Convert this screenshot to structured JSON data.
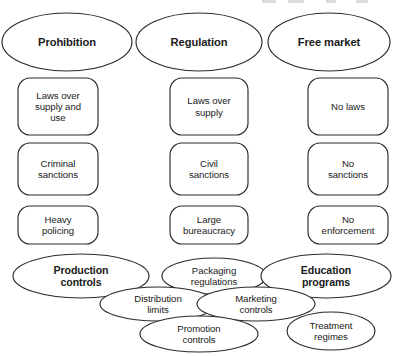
{
  "diagram": {
    "stroke_color": "#2b2b2b",
    "fill_color": "#ffffff",
    "categories": [
      {
        "id": "prohibition",
        "label": "Prohibition",
        "cx": 67,
        "cy": 42,
        "rx": 65,
        "ry": 29
      },
      {
        "id": "regulation",
        "label": "Regulation",
        "cx": 199,
        "cy": 42,
        "rx": 63,
        "ry": 29
      },
      {
        "id": "free-market",
        "label": "Free market",
        "cx": 329,
        "cy": 42,
        "rx": 61,
        "ry": 29
      }
    ],
    "attribute_rows": [
      {
        "row_id": "laws",
        "items": [
          {
            "id": "laws-over-supply-and-use",
            "label": "Laws over\nsupply and\nuse",
            "x": 18,
            "y": 78,
            "w": 80,
            "h": 57
          },
          {
            "id": "laws-over-supply",
            "label": "Laws over\nsupply",
            "x": 170,
            "y": 78,
            "w": 78,
            "h": 57
          },
          {
            "id": "no-laws",
            "label": "No laws",
            "x": 308,
            "y": 78,
            "w": 80,
            "h": 57
          }
        ]
      },
      {
        "row_id": "sanctions",
        "items": [
          {
            "id": "criminal-sanctions",
            "label": "Criminal\nsanctions",
            "x": 18,
            "y": 143,
            "w": 80,
            "h": 52
          },
          {
            "id": "civil-sanctions",
            "label": "Civil\nsanctions",
            "x": 170,
            "y": 143,
            "w": 78,
            "h": 52
          },
          {
            "id": "no-sanctions",
            "label": "No\nsanctions",
            "x": 308,
            "y": 143,
            "w": 80,
            "h": 52
          }
        ]
      },
      {
        "row_id": "enforcement",
        "items": [
          {
            "id": "heavy-policing",
            "label": "Heavy\npolicing",
            "x": 18,
            "y": 206,
            "w": 80,
            "h": 38
          },
          {
            "id": "large-bureaucracy",
            "label": "Large\nbureaucracy",
            "x": 170,
            "y": 206,
            "w": 78,
            "h": 38
          },
          {
            "id": "no-enforcement",
            "label": "No\nenforcement",
            "x": 308,
            "y": 206,
            "w": 80,
            "h": 38
          }
        ]
      }
    ],
    "instruments": [
      {
        "id": "production-controls",
        "label": "Production\ncontrols",
        "cx": 81,
        "cy": 276,
        "rx": 68,
        "ry": 22,
        "weight": "bold",
        "order": 1
      },
      {
        "id": "packaging-regulations",
        "label": "Packaging\nregulations",
        "cx": 214,
        "cy": 276,
        "rx": 52,
        "ry": 18,
        "weight": "normal",
        "order": 2
      },
      {
        "id": "education-programs",
        "label": "Education\nprograms",
        "cx": 326,
        "cy": 276,
        "rx": 65,
        "ry": 22,
        "weight": "bold",
        "order": 3
      },
      {
        "id": "distribution-limits",
        "label": "Distribution\nlimits",
        "cx": 158,
        "cy": 304,
        "rx": 58,
        "ry": 17,
        "weight": "normal",
        "order": 4
      },
      {
        "id": "marketing-controls",
        "label": "Marketing\ncontrols",
        "cx": 256,
        "cy": 304,
        "rx": 59,
        "ry": 17,
        "weight": "normal",
        "order": 5
      },
      {
        "id": "treatment-regimes",
        "label": "Treatment\nregimes",
        "cx": 331,
        "cy": 331,
        "rx": 44,
        "ry": 19,
        "weight": "normal",
        "order": 6
      },
      {
        "id": "promotion-controls",
        "label": "Promotion\ncontrols",
        "cx": 199,
        "cy": 334,
        "rx": 59,
        "ry": 18,
        "weight": "normal",
        "order": 7
      }
    ]
  }
}
